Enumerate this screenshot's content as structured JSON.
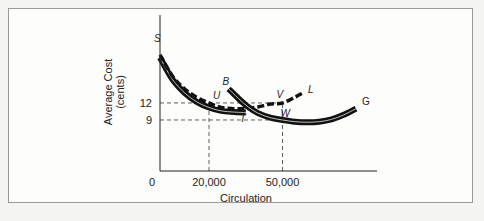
{
  "chart_data": {
    "type": "line",
    "title": "",
    "xlabel": "Circulation",
    "ylabel": "Average Cost",
    "ylabel_unit": "(cents)",
    "x_origin_label": "0",
    "xticks": [
      {
        "value": 20000,
        "label": "20,000"
      },
      {
        "value": 50000,
        "label": "50,000"
      }
    ],
    "yticks": [
      {
        "value": 9,
        "label": "9"
      },
      {
        "value": 12,
        "label": "12"
      }
    ],
    "xlim": [
      0,
      88000
    ],
    "ylim": [
      0,
      27
    ],
    "grid": false,
    "legend": "none",
    "series": [
      {
        "name": "S-curve (solid double)",
        "style": "solid-double",
        "end_label": "S",
        "points": [
          [
            0,
            20
          ],
          [
            5000,
            16.2
          ],
          [
            10000,
            13.8
          ],
          [
            15000,
            12.2
          ],
          [
            20000,
            11.2
          ],
          [
            25000,
            10.6
          ],
          [
            30000,
            10.4
          ],
          [
            35000,
            10.3
          ]
        ]
      },
      {
        "name": "S-L envelope (dashed)",
        "style": "dashed",
        "start_label": "S",
        "end_label": "L",
        "points": [
          [
            0,
            20.5
          ],
          [
            5000,
            16.8
          ],
          [
            10000,
            14.5
          ],
          [
            15000,
            13
          ],
          [
            20000,
            12
          ],
          [
            25000,
            11.2
          ],
          [
            30000,
            11
          ],
          [
            35000,
            11
          ],
          [
            40000,
            11.3
          ],
          [
            45000,
            11.8
          ],
          [
            50000,
            12
          ],
          [
            55000,
            13
          ],
          [
            58000,
            13.7
          ]
        ]
      },
      {
        "name": "B-G curve (solid double)",
        "style": "solid-double",
        "start_label": "B",
        "end_label": "G",
        "points": [
          [
            28000,
            14.5
          ],
          [
            32000,
            12.8
          ],
          [
            36000,
            11.3
          ],
          [
            40000,
            10.2
          ],
          [
            45000,
            9.4
          ],
          [
            50000,
            9
          ],
          [
            55000,
            8.7
          ],
          [
            60000,
            8.6
          ],
          [
            65000,
            8.7
          ],
          [
            70000,
            9.1
          ],
          [
            75000,
            9.9
          ],
          [
            80000,
            11
          ]
        ]
      }
    ],
    "guides": [
      {
        "from": [
          0,
          12
        ],
        "to": [
          50000,
          12
        ],
        "style": "dashed"
      },
      {
        "from": [
          0,
          9
        ],
        "to": [
          50000,
          9
        ],
        "style": "dashed"
      },
      {
        "from": [
          20000,
          0
        ],
        "to": [
          20000,
          12
        ],
        "style": "dashed"
      },
      {
        "from": [
          50000,
          0
        ],
        "to": [
          50000,
          12
        ],
        "style": "dashed"
      }
    ],
    "annotations": [
      {
        "text": "S",
        "at": [
          0,
          22
        ]
      },
      {
        "text": "U",
        "at": [
          20000,
          12
        ]
      },
      {
        "text": "B",
        "at": [
          28000,
          14.5
        ]
      },
      {
        "text": "V",
        "at": [
          50000,
          12
        ]
      },
      {
        "text": "L",
        "at": [
          58000,
          13.7
        ]
      },
      {
        "text": "T",
        "at": [
          35000,
          9
        ]
      },
      {
        "text": "W",
        "at": [
          50000,
          9
        ]
      },
      {
        "text": "G",
        "at": [
          80000,
          11
        ]
      }
    ]
  },
  "caption": "Figure 11.1"
}
